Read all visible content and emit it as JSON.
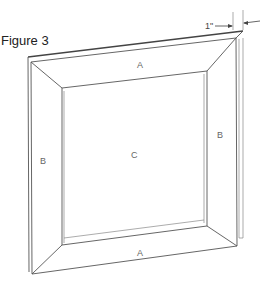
{
  "figure": {
    "title": "Figure 3",
    "labels": {
      "top_rail": "A",
      "bottom_rail": "A",
      "left_stile": "B",
      "right_stile": "B",
      "center_panel": "C"
    },
    "dimension": {
      "value": "1\""
    }
  }
}
